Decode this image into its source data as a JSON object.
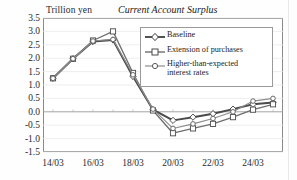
{
  "chart_data": {
    "type": "line",
    "title": "Current Account Surplus",
    "unit_label": "Trillion yen",
    "xlabel": "",
    "ylabel": "Trillion yen",
    "ylim": [
      -1.5,
      3.5
    ],
    "ytick_values": [
      3.5,
      3.0,
      2.5,
      2.0,
      1.5,
      1.0,
      0.5,
      0.0,
      -0.5,
      -1.0,
      -1.5
    ],
    "ytick_labels": [
      "3.5",
      "3.0",
      "2.5",
      "2.0",
      "1.5",
      "1.0",
      "0.5",
      "0.0",
      "-0.5",
      "-1.0",
      "-1.5"
    ],
    "x": [
      "14/03",
      "15/03",
      "16/03",
      "17/03",
      "18/03",
      "19/03",
      "20/03",
      "21/03",
      "22/03",
      "23/03",
      "24/03",
      "25/03"
    ],
    "xtick_labels": [
      "14/03",
      "16/03",
      "18/03",
      "20/03",
      "22/03",
      "24/03"
    ],
    "xtick_indices": [
      0,
      2,
      4,
      6,
      8,
      10
    ],
    "grid": "horizontal-light",
    "zero_line": 0.0,
    "legend_position": "upper-right-inside",
    "series": [
      {
        "name": "Baseline",
        "marker": "diamond",
        "color": "#4a4a4a",
        "values": [
          1.25,
          1.98,
          2.62,
          2.68,
          1.32,
          0.08,
          -0.32,
          -0.2,
          -0.07,
          0.1,
          0.28,
          0.35
        ]
      },
      {
        "name": "Extension of purchases",
        "marker": "square",
        "color": "#6e6e6e",
        "values": [
          1.25,
          1.98,
          2.66,
          3.0,
          1.45,
          0.05,
          -0.8,
          -0.62,
          -0.45,
          -0.2,
          0.08,
          0.28
        ]
      },
      {
        "name": "Higher-than-expected\ninterest rates",
        "marker": "circle",
        "color": "#8c8c8c",
        "values": [
          1.25,
          1.98,
          2.64,
          2.7,
          1.38,
          0.1,
          -0.62,
          -0.45,
          -0.25,
          0.0,
          0.4,
          0.5
        ]
      }
    ]
  },
  "legend": {
    "items": [
      {
        "label": "Baseline"
      },
      {
        "label": "Extension of purchases"
      },
      {
        "label": "Higher-than-expected\ninterest rates"
      }
    ]
  }
}
